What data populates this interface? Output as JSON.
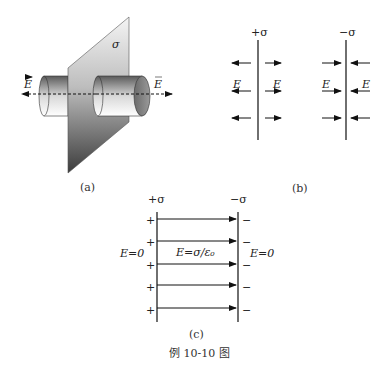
{
  "figure": {
    "caption": "例 10-10 图",
    "panels": {
      "a": {
        "label": "(a)",
        "sheet_charge": "σ",
        "field_left": "E",
        "field_right": "E",
        "description": "Infinite charged plane with cylindrical Gaussian surface; field E points outward on both sides"
      },
      "b": {
        "label": "(b)",
        "positive_plate": {
          "charge": "+σ",
          "field_left": "E",
          "field_right": "E",
          "direction": "outward"
        },
        "negative_plate": {
          "charge": "−σ",
          "field_left": "E",
          "field_right": "E",
          "direction": "inward"
        }
      },
      "c": {
        "label": "(c)",
        "left_plate_charge": "+σ",
        "right_plate_charge": "−σ",
        "plus_signs": [
          "+",
          "+",
          "+",
          "+",
          "+"
        ],
        "minus_signs": [
          "−",
          "−",
          "−",
          "−",
          "−"
        ],
        "outside_left": "E=0",
        "inside": "E=σ/ε₀",
        "outside_right": "E=0"
      }
    }
  }
}
